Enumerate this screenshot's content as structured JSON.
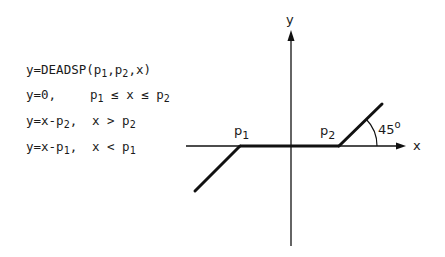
{
  "equations": {
    "definition": {
      "prefix": "y=DEADSP(p",
      "s1": "1",
      "mid1": ",p",
      "s2": "2",
      "suffix": ",x)"
    },
    "case_zero": {
      "lhs": "y=0,",
      "c_p": "p",
      "c_s1": "1",
      "c_mid": " ≤ x ≤ p",
      "c_s2": "2"
    },
    "case_above": {
      "lhs_a": "y=x-p",
      "lhs_s": "2",
      "lhs_b": ",",
      "c_a": "x > p",
      "c_s": "2"
    },
    "case_below": {
      "lhs_a": "y=x-p",
      "lhs_s": "1",
      "lhs_b": ",",
      "c_a": "x < p",
      "c_s": "1"
    }
  },
  "graph": {
    "y_axis_label": "y",
    "x_axis_label": "x",
    "p1_label": "p",
    "p1_sub": "1",
    "p2_label": "p",
    "p2_sub": "2",
    "angle_label": "45",
    "angle_sup": "o",
    "line_color": "#111111"
  }
}
